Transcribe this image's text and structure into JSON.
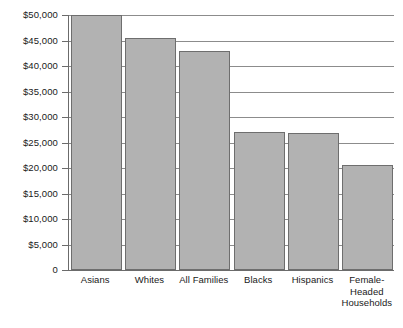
{
  "chart_data": {
    "type": "bar",
    "title": "",
    "xlabel": "",
    "ylabel": "",
    "categories": [
      "Asians",
      "Whites",
      "All Families",
      "Blacks",
      "Hispanics",
      "Female-Headed Households"
    ],
    "values": [
      50000,
      45400,
      42900,
      27100,
      26900,
      20500
    ],
    "ylim": [
      0,
      50000
    ],
    "ytick_values": [
      50000,
      45000,
      40000,
      35000,
      30000,
      25000,
      20000,
      15000,
      10000,
      5000,
      0
    ],
    "ytick_labels": [
      "$50,000",
      "$45,000",
      "$40,000",
      "$35,000",
      "$30,000",
      "$25,000",
      "$20,000",
      "$15,000",
      "$10,000",
      "$5,000",
      "0"
    ],
    "grid": true,
    "legend": false,
    "bar_color": "#b2b2b2",
    "bar_border_color": "#6e6e6e",
    "axis_color": "#6b6b6b",
    "grid_color": "#8c8c8c",
    "category_label_lines": [
      [
        "Asians"
      ],
      [
        "Whites"
      ],
      [
        "All Families"
      ],
      [
        "Blacks"
      ],
      [
        "Hispanics"
      ],
      [
        "Female-",
        "Headed",
        "Households"
      ]
    ]
  }
}
